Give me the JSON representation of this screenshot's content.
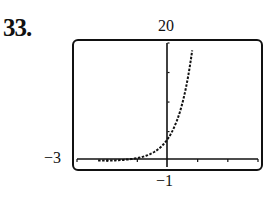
{
  "problem_number": "33.",
  "window": {
    "ymax_label": "20",
    "xmin_label": "−3",
    "ymin_label": "−1"
  },
  "chart_data": {
    "type": "line",
    "title": "",
    "xlabel": "",
    "ylabel": "",
    "xlim": [
      -3,
      3
    ],
    "ylim": [
      -1,
      20
    ],
    "xscl": 1,
    "yscl": 5,
    "grid": false,
    "legend": null,
    "style": "graphing-calculator dotted curve",
    "series": [
      {
        "name": "f(x)",
        "x": [
          -3,
          -2.5,
          -2,
          -1.5,
          -1,
          -0.5,
          0,
          0.25,
          0.5,
          0.75,
          0.85
        ],
        "y": [
          0.1,
          0.15,
          0.3,
          0.6,
          1.2,
          2.2,
          3.7,
          6.0,
          9.5,
          15.5,
          20
        ]
      }
    ],
    "tick_labels": {
      "top": "20",
      "left": "-3",
      "bottom": "-1"
    }
  }
}
